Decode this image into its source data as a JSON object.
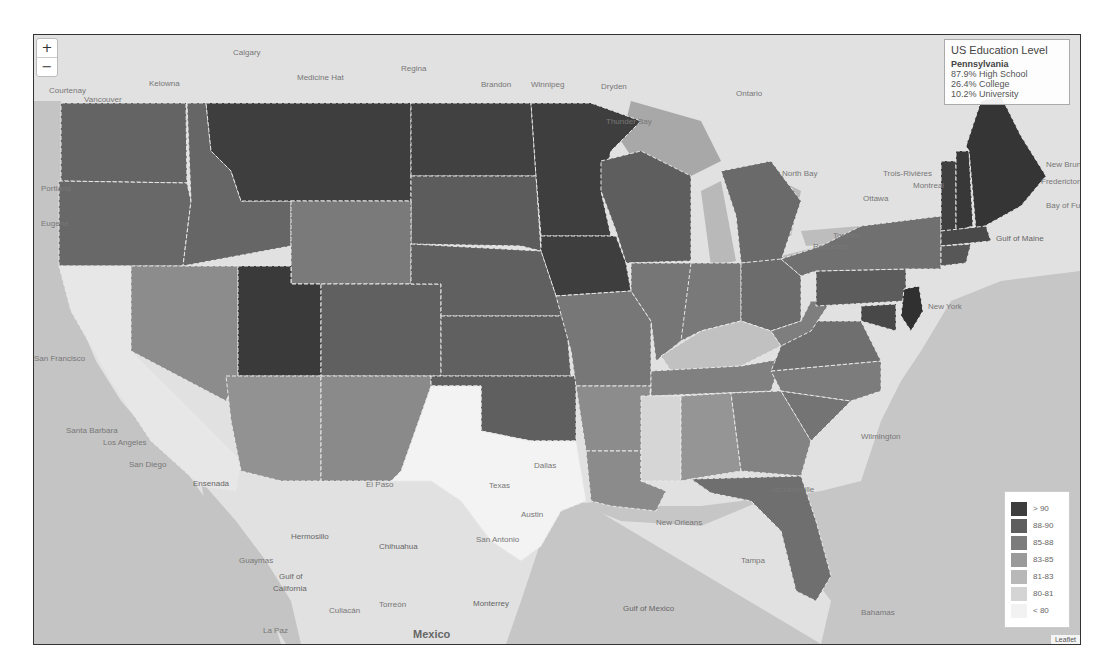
{
  "map": {
    "controls": {
      "zoom_in": "+",
      "zoom_out": "−"
    },
    "info": {
      "title": "US Education Level",
      "state": "Pennsylvania",
      "high_school": "87.9% High School",
      "college": "26.4% College",
      "university": "10.2% University"
    },
    "legend": {
      "items": [
        {
          "label": "> 90",
          "color": "#3d3d3d"
        },
        {
          "label": "88-90",
          "color": "#5e5e5e"
        },
        {
          "label": "85-88",
          "color": "#7c7c7c"
        },
        {
          "label": "83-85",
          "color": "#9a9a9a"
        },
        {
          "label": "81-83",
          "color": "#b8b8b8"
        },
        {
          "label": "80-81",
          "color": "#d4d4d4"
        },
        {
          "label": "< 80",
          "color": "#f2f2f2"
        }
      ]
    },
    "attribution": "Leaflet",
    "cities": {
      "calgary": "Calgary",
      "courtenay": "Courtenay",
      "vancouver": "Vancouver",
      "kelowna": "Kelowna",
      "medicine_hat": "Medicine Hat",
      "regina": "Regina",
      "brandon": "Brandon",
      "winnipeg": "Winnipeg",
      "dryden": "Dryden",
      "ontario": "Ontario",
      "thunder_bay": "Thunder Bay",
      "north_bay": "North Bay",
      "trois_rivieres": "Trois-Rivières",
      "montreal": "Montreal",
      "ottawa": "Ottawa",
      "toronto": "Toronto",
      "rochester": "Rochester",
      "new_brunswick": "New Brunswick",
      "fredericton": "Fredericton",
      "bay_of_fundy": "Bay of Fundy",
      "gulf_of_maine": "Gulf of Maine",
      "new_york": "New York",
      "wilmington": "Wilmington",
      "san_francisco": "San Francisco",
      "santa_barbara": "Santa Barbara",
      "los_angeles": "Los Angeles",
      "san_diego": "San Diego",
      "ensenada": "Ensenada",
      "hermosillo": "Hermosillo",
      "chihuahua": "Chihuahua",
      "guaymas": "Guaymas",
      "gulf_of_california": "Gulf of California",
      "culiacan": "Culiacán",
      "torreon": "Torreón",
      "monterrey": "Monterrey",
      "la_paz": "La Paz",
      "mexico": "Mexico",
      "dallas": "Dallas",
      "texas": "Texas",
      "austin": "Austin",
      "san_antonio": "San Antonio",
      "el_paso": "El Paso",
      "new_orleans": "New Orleans",
      "tampa": "Tampa",
      "jacksonville": "Jacksonville",
      "miami": "Miami",
      "gulf_of_mexico": "Gulf of Mexico",
      "bahamas": "Bahamas",
      "portland": "Portland",
      "eugene": "Eugene",
      "salem": "Salem"
    }
  }
}
